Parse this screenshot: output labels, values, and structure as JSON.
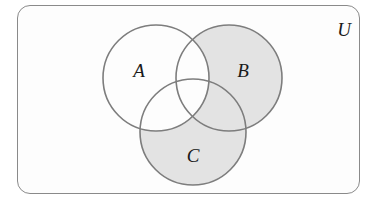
{
  "diagram": {
    "type": "venn",
    "universe_label": "U",
    "sets": [
      {
        "id": "A",
        "label": "A",
        "cx": 156,
        "cy": 78,
        "r": 53
      },
      {
        "id": "B",
        "label": "B",
        "cx": 229,
        "cy": 78,
        "r": 53
      },
      {
        "id": "C",
        "label": "C",
        "cx": 193,
        "cy": 132,
        "r": 53
      }
    ],
    "shaded_region": "(B ∪ C) − A",
    "shaded_regions_list": [
      "B only",
      "C only",
      "B ∩ C only"
    ],
    "colors": {
      "shade": "#e3e3e3",
      "outline": "#7d7d7d",
      "background": "#fdfdfd",
      "frame": "#8a8a8a"
    }
  }
}
